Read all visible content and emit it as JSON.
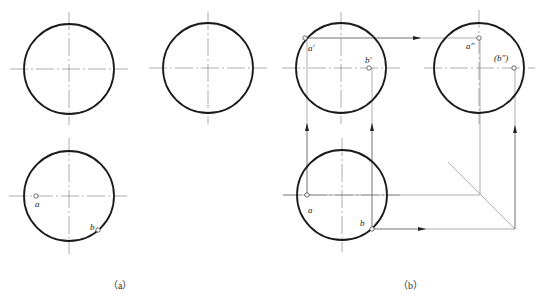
{
  "figure": {
    "captions": {
      "a": "（a）",
      "b": "（b）"
    },
    "colors": {
      "outline": "#1a1a1a",
      "thin": "#777777",
      "background": "#ffffff"
    },
    "panel_a": {
      "views": [
        {
          "name": "front-view",
          "cx": 69,
          "cy": 69,
          "r": 45
        },
        {
          "name": "side-view",
          "cx": 208,
          "cy": 68,
          "r": 45
        },
        {
          "name": "top-view",
          "cx": 69,
          "cy": 196,
          "r": 45
        }
      ],
      "points": [
        {
          "label": "a",
          "x": 36,
          "y": 196
        },
        {
          "label": "b",
          "x": 98,
          "y": 230
        }
      ]
    },
    "panel_b": {
      "views": [
        {
          "name": "front-view",
          "cx": 341,
          "cy": 68,
          "r": 45
        },
        {
          "name": "side-view",
          "cx": 479,
          "cy": 68,
          "r": 45
        },
        {
          "name": "top-view",
          "cx": 342,
          "cy": 195,
          "r": 45
        }
      ],
      "points": [
        {
          "label": "a'",
          "x": 305,
          "y": 38
        },
        {
          "label": "b'",
          "x": 369,
          "y": 68
        },
        {
          "label": "a\"",
          "x": 479,
          "y": 38
        },
        {
          "label": "(b\")",
          "x": 514,
          "y": 68
        },
        {
          "label": "a",
          "x": 307,
          "y": 195
        },
        {
          "label": "b",
          "x": 372,
          "y": 229
        }
      ]
    }
  }
}
